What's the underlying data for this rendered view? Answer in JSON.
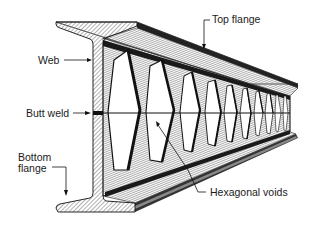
{
  "diagram": {
    "colors": {
      "line": "#1a1a1a",
      "hatch": "#6a6a6a",
      "background": "#ffffff",
      "void": "#ffffff"
    },
    "labels": [
      {
        "id": "top-flange",
        "text": "Top flange"
      },
      {
        "id": "web",
        "text": "Web"
      },
      {
        "id": "butt-weld",
        "text": "Butt weld"
      },
      {
        "id": "bottom-flange-line1",
        "text": "Bottom"
      },
      {
        "id": "bottom-flange-line2",
        "text": "flange"
      },
      {
        "id": "hexagonal-voids",
        "text": "Hexagonal voids"
      }
    ],
    "void_count": 10
  }
}
